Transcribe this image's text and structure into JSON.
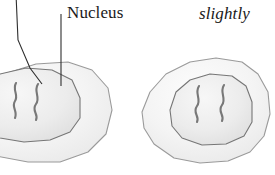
{
  "figure": {
    "kind": "biology-illustration",
    "background_color": "#ffffff"
  },
  "labels": {
    "nucleus": "Nucleus",
    "caption_partial": "slightly "
  },
  "colors": {
    "cell_fill": "#f2f2f2",
    "cell_fill_light": "#fbfbfb",
    "cell_outline": "#8f8f8f",
    "nucleus_fill": "#ebebeb",
    "nucleus_outline": "#6e6e6e",
    "chromosome": "#777777",
    "leader_line": "#333333",
    "text": "#1a1a1a"
  },
  "cells": [
    {
      "name": "left-cell",
      "cropped_at_left_edge": true,
      "cell_outline_points": "-40,108 -24,88 4,74 36,64 68,62 92,70 108,88 112,110 106,134 88,152 60,162 28,162 -4,156 -28,142 -40,124",
      "nucleus_outline_points": "-30,104 -20,86 0,74 26,68 52,70 72,80 80,98 80,118 70,132 50,140 24,142 0,138 -20,128 -30,116",
      "chromosomes": [
        {
          "name": "chromosome-1",
          "path": "M16,83 C12,90 19,95 15,101 C11,107 18,111 15,118"
        },
        {
          "name": "chromosome-2",
          "path": "M38,84 C33,92 41,97 36,104 C31,111 39,114 36,120"
        }
      ]
    },
    {
      "name": "right-cell",
      "cropped_at_left_edge": false,
      "cell_outline_points": "142,112 150,92 166,74 190,62 216,58 242,62 258,74 268,92 270,114 264,136 250,152 228,161 200,163 174,158 154,144 144,128",
      "nucleus_outline_points": "170,110 176,92 190,80 210,74 232,76 246,86 252,102 252,122 244,136 226,144 202,145 182,138 172,126",
      "chromosomes": [
        {
          "name": "chromosome-1",
          "path": "M199,86 C194,94 202,99 197,106 C192,113 200,116 197,122"
        },
        {
          "name": "chromosome-2",
          "path": "M224,85 C219,93 227,98 222,105 C217,112 225,115 222,121"
        }
      ]
    }
  ],
  "leader_lines": [
    {
      "name": "leader-line-chromosome",
      "path": "M16,-6 L18,40 L30,68 L42,84",
      "target": "chromosome-tip-left-cell"
    },
    {
      "name": "leader-line-nucleus",
      "path": "M61,14 L61,50 L61,86",
      "target": "nucleus-membrane-left-cell"
    }
  ]
}
